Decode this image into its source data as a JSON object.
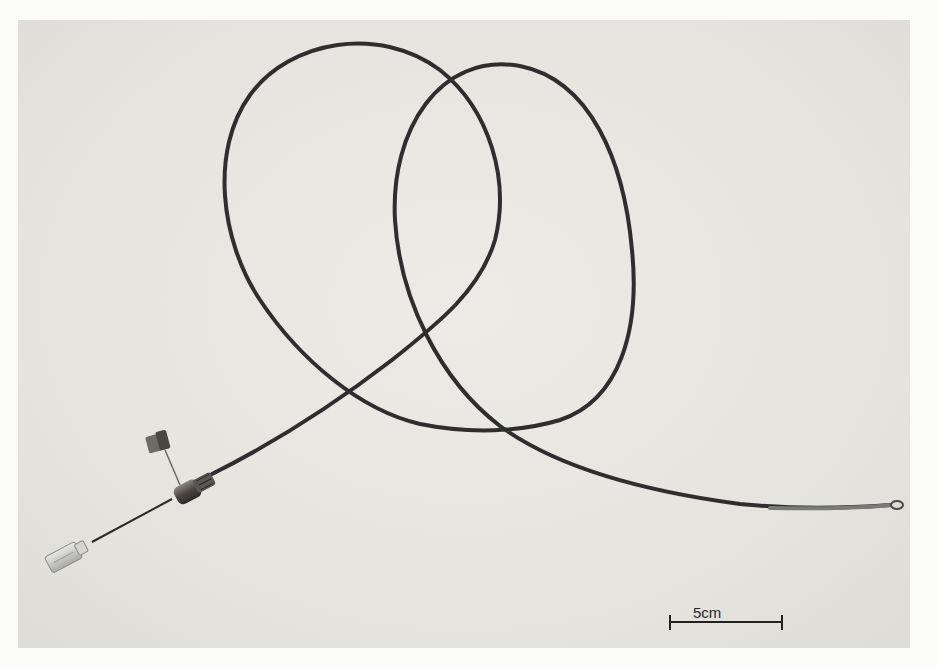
{
  "image": {
    "subject": "catheter with hub, side cap and looped tubing on plain background",
    "background_color": "#e6e5df",
    "catheter_color": "#2e2e2e"
  },
  "scale_bar": {
    "label": "5cm",
    "length_px": 112
  }
}
